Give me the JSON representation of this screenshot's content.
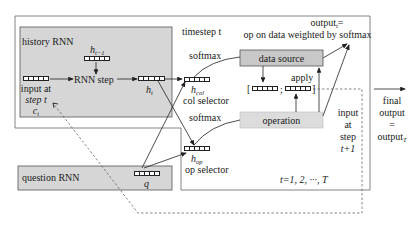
{
  "diagram": {
    "boxes": {
      "history_rnn": {
        "label": "history RNN",
        "fill": "#d6d6d6"
      },
      "question_rnn": {
        "label": "question RNN",
        "fill": "#d6d6d6"
      },
      "data_source": {
        "label": "data source",
        "fill": "#c8c8c8"
      },
      "operation": {
        "label": "operation",
        "fill": "#dcdcdc"
      }
    },
    "labels": {
      "timestep": "timestep t",
      "output_t_line1": "output",
      "output_t_sub": "t",
      "output_t_eq": "=",
      "output_desc": "op on data weighted by softmax",
      "softmax_col": "softmax",
      "softmax_op": "softmax",
      "apply": "apply",
      "rnn_step": "RNN step",
      "h_prev": "h",
      "h_prev_sub": "t−1",
      "h_t": "h",
      "h_t_sub": "t",
      "h_col": "h",
      "h_col_sub": "col",
      "col_selector": "col selector",
      "h_op": "h",
      "h_op_sub": "op",
      "op_selector": "op selector",
      "input_at": "input at",
      "step_t": "step t",
      "c_t": "c",
      "c_t_sub": "t",
      "q": "q",
      "input_next_1": "input",
      "input_next_2": "at",
      "input_next_3": "step",
      "input_next_4": "t+1",
      "range": "t=1, 2, ···, T",
      "final_1": "final",
      "final_2": "output",
      "final_3": "=",
      "final_4": "output",
      "final_4_sub": "T",
      "bracket_open": "[",
      "bracket_sep": ";",
      "bracket_close": "]"
    },
    "colors": {
      "line": "#222222",
      "frame": "#555555",
      "dashed": "#555555"
    }
  }
}
